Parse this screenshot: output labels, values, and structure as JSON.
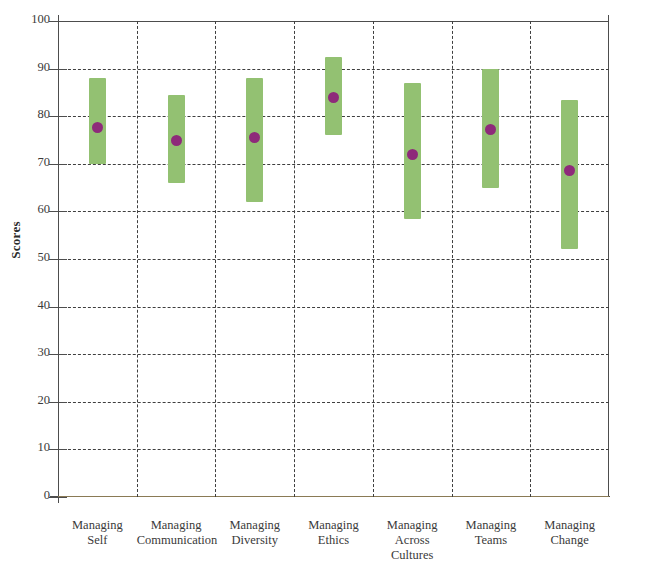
{
  "chart_data": {
    "type": "bar",
    "title": "",
    "subtitle": "",
    "xlabel": "",
    "ylabel": "Scores",
    "ylim": [
      0,
      100
    ],
    "xlim_note": "seven categories evenly spaced",
    "grid": "horizontal dashed gridlines at every 10 units; vertical dashed separators between categories",
    "legend": "none",
    "legend_position": "none",
    "y_ticks": [
      0,
      10,
      20,
      30,
      40,
      50,
      60,
      70,
      80,
      90,
      100
    ],
    "categories": [
      "Managing Self",
      "Managing Communication",
      "Managing Diversity",
      "Managing Ethics",
      "Managing Across Cultures",
      "Managing Teams",
      "Managing Change"
    ],
    "category_lines": [
      [
        "Managing",
        "Self"
      ],
      [
        "Managing",
        "Communication"
      ],
      [
        "Managing",
        "Diversity"
      ],
      [
        "Managing",
        "Ethics"
      ],
      [
        "Managing",
        "Across",
        "Cultures"
      ],
      [
        "Managing",
        "Teams"
      ],
      [
        "Managing",
        "Change"
      ]
    ],
    "series": [
      {
        "name": "range",
        "kind": "range-bar",
        "color": "#93c172",
        "low": [
          70.0,
          66.0,
          62.0,
          76.0,
          58.5,
          65.0,
          52.0
        ],
        "high": [
          88.0,
          84.5,
          88.0,
          92.5,
          87.0,
          90.0,
          83.5
        ]
      },
      {
        "name": "mean",
        "kind": "point",
        "color": "#8e2a7a",
        "values": [
          77.7,
          75.0,
          75.5,
          84.0,
          72.0,
          77.2,
          68.6
        ]
      }
    ]
  },
  "colors": {
    "bar": "#93c172",
    "point": "#8e2a7a",
    "axis": "#4d4d4d",
    "grid": "#3f3f3f",
    "text": "#3a3a3a",
    "baseline": "#8a7a55",
    "background": "#ffffff"
  }
}
